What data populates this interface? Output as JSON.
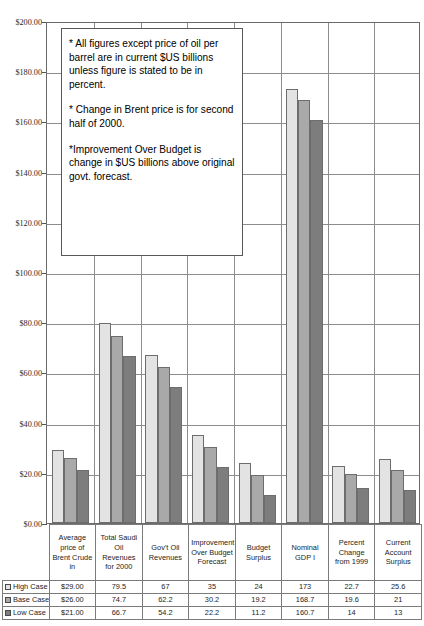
{
  "chart_data": {
    "type": "bar",
    "title": "",
    "xlabel": "",
    "ylabel": "",
    "ylim": [
      0,
      200
    ],
    "ytick_prefix": "$",
    "grid": true,
    "legend_position": "bottom-left-table",
    "yticks": [
      "$0.00",
      "$20.00",
      "$40.00",
      "$60.00",
      "$80.00",
      "$100.00",
      "$120.00",
      "$140.00",
      "$160.00",
      "$180.00",
      "$200.00"
    ],
    "ytick_values": [
      0,
      20,
      40,
      60,
      80,
      100,
      120,
      140,
      160,
      180,
      200
    ],
    "categories": [
      "Average price of Brent Crude in",
      "Total Saudi Oil Revenues for 2000",
      "Gov't Oil Revenues",
      "Improvement Over Budget Forecast",
      "Budget Surplus",
      "Nominal GDP I",
      "Percent Change from 1999",
      "Current Account Surplus"
    ],
    "series": [
      {
        "name": "High Case",
        "color": "#e3e3e3",
        "values": [
          29.0,
          79.5,
          67,
          35,
          24,
          173,
          22.7,
          25.6
        ],
        "labels": [
          "$29.00",
          "79.5",
          "67",
          "35",
          "24",
          "173",
          "22.7",
          "25.6"
        ]
      },
      {
        "name": "Base Case",
        "color": "#a9a9a9",
        "values": [
          26.0,
          74.7,
          62.2,
          30.2,
          19.2,
          168.7,
          19.6,
          21
        ],
        "labels": [
          "$26.00",
          "74.7",
          "62.2",
          "30.2",
          "19.2",
          "168.7",
          "19.6",
          "21"
        ]
      },
      {
        "name": "Low Case",
        "color": "#7d7d7d",
        "values": [
          21.0,
          66.7,
          54.2,
          22.2,
          11.2,
          160.7,
          14,
          13
        ],
        "labels": [
          "$21.00",
          "66.7",
          "54.2",
          "22.2",
          "11.2",
          "160.7",
          "14",
          "13"
        ]
      }
    ],
    "annotations": [
      "* All figures except price of oil per barrel are in current $US billions unless figure is stated to be in percent.",
      "* Change in  Brent price is for second half of 2000.",
      "*Improvement Over Budget is change in $US billions above original govt. forecast."
    ]
  },
  "note_box": {
    "paragraphs": [
      "* All figures except price of oil per barrel are in current $US billions unless figure is stated to be in percent.",
      "* Change in  Brent price is for second half of 2000.",
      "*Improvement Over Budget is change in $US billions above original govt. forecast."
    ]
  }
}
